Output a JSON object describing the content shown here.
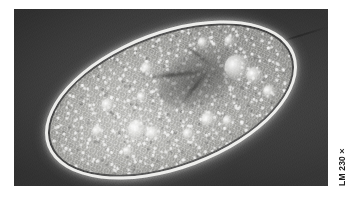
{
  "figure": {
    "kind": "light-micrograph",
    "technique": "phase-contrast light microscopy",
    "caption": {
      "magnification_label": "LM 230×",
      "orientation": "rotated-90-ccw",
      "position": "right-edge"
    },
    "plate": {
      "background_color": "#3f3f3f",
      "border_color": "#ffffff",
      "width_px": 314,
      "height_px": 177
    },
    "organism": {
      "shape": "ellipse",
      "tilt_degrees": -20.5,
      "membrane_color": "#f6f6f4",
      "cytoplasm_color": "#bdbdb9",
      "nucleus_color": "#4a4a48",
      "vacuole_color": "#ffffff",
      "features": [
        "bright pellicle halo",
        "granular cytoplasm",
        "dark macronucleus region",
        "food vacuoles"
      ]
    }
  }
}
